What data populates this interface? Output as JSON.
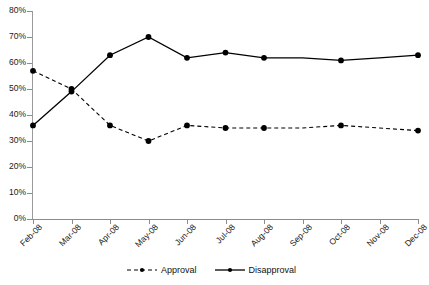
{
  "chart_data": {
    "type": "line",
    "title": "",
    "subtitle": "",
    "xlabel": "",
    "ylabel": "",
    "categories": [
      "Feb-08",
      "Mar-08",
      "Apr-08",
      "May-08",
      "Jun-08",
      "Jul-08",
      "Aug-08",
      "Sep-08",
      "Oct-08",
      "Nov-08",
      "Dec-08"
    ],
    "series": [
      {
        "name": "Approval",
        "style": "dashed",
        "marker": "circle",
        "color": "#000000",
        "values": [
          57,
          50,
          36,
          30,
          36,
          35,
          35,
          35,
          36,
          35,
          34
        ]
      },
      {
        "name": "Disapproval",
        "style": "solid",
        "marker": "circle",
        "color": "#000000",
        "values": [
          36,
          49,
          63,
          70,
          62,
          64,
          62,
          62,
          61,
          62,
          63
        ]
      }
    ],
    "ylim": [
      0,
      80
    ],
    "ytick_values": [
      0,
      10,
      20,
      30,
      40,
      50,
      60,
      70,
      80
    ],
    "ytick_labels": [
      "0%",
      "10%",
      "20%",
      "30%",
      "40%",
      "50%",
      "60%",
      "70%",
      "80%"
    ],
    "grid": false,
    "legend_position": "bottom"
  },
  "legend": {
    "items": [
      {
        "label": "Approval",
        "swatch": "dashed-line-with-marker"
      },
      {
        "label": "Disapproval",
        "swatch": "solid-line-with-marker"
      }
    ]
  }
}
